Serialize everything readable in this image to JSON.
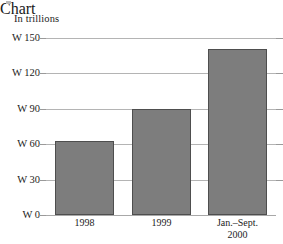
{
  "chart_data": {
    "type": "bar",
    "title": "In trillions",
    "subtitle": "",
    "xlabel": "",
    "ylabel": "",
    "currency_symbol": "W",
    "categories": [
      "1998",
      "1999",
      "Jan.–Sept. 2000"
    ],
    "category_lines": [
      [
        "1998"
      ],
      [
        "1999"
      ],
      [
        "Jan.–Sept.",
        "2000"
      ]
    ],
    "values": [
      63,
      90,
      141
    ],
    "ylim": [
      0,
      150
    ],
    "yticks": [
      0,
      30,
      60,
      90,
      120,
      150
    ],
    "ytick_labels": [
      "W 0",
      "W 30",
      "W 60",
      "W 90",
      "W 120",
      "W 150"
    ],
    "grid": true,
    "legend": false,
    "legend_position": "none",
    "bar_color": "#7d7d7d",
    "bar_border_color": "#4e4e4e",
    "gridline_color": "#b4b4b4",
    "axis_color": "#a8a8a8"
  },
  "figure": {
    "caption": "In trillions"
  }
}
